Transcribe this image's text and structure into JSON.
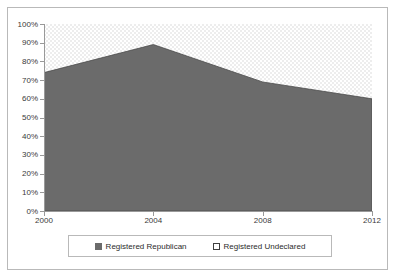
{
  "chart_data": {
    "type": "area",
    "stacked": true,
    "title": "",
    "subtitle": "",
    "xlabel": "",
    "ylabel": "",
    "x": [
      2000,
      2004,
      2008,
      2012
    ],
    "xticklabels": [
      "2000",
      "2004",
      "2008",
      "2012"
    ],
    "xlim": [
      2000,
      2012
    ],
    "ylim": [
      0,
      100
    ],
    "yticks": [
      0,
      10,
      20,
      30,
      40,
      50,
      60,
      70,
      80,
      90,
      100
    ],
    "yticklabels": [
      "0%",
      "10%",
      "20%",
      "30%",
      "40%",
      "50%",
      "60%",
      "70%",
      "80%",
      "90%",
      "100%"
    ],
    "grid": false,
    "legend_position": "bottom",
    "series": [
      {
        "name": "Registered Republican",
        "values": [
          74,
          89,
          69,
          60
        ],
        "color": "#6b6b6b",
        "swatch": "filled"
      },
      {
        "name": "Registered Undeclared",
        "values": [
          26,
          11,
          31,
          40
        ],
        "color": "#ffffff",
        "swatch": "hollow"
      }
    ]
  },
  "axes": {
    "y_labels": [
      "100%",
      "90%",
      "80%",
      "70%",
      "60%",
      "50%",
      "40%",
      "30%",
      "20%",
      "10%",
      "0%"
    ],
    "x_labels": [
      "2000",
      "2004",
      "2008",
      "2012"
    ]
  },
  "legend": {
    "items": [
      {
        "label": "Registered Republican",
        "swatch": "filled"
      },
      {
        "label": "Registered Undeclared",
        "swatch": "hollow"
      }
    ]
  },
  "colors": {
    "republican_fill": "#6b6b6b",
    "undeclared_fill": "#ffffff",
    "undeclared_pattern": "#ededed",
    "axis": "#999999",
    "frame_border": "#b9b9b9",
    "text": "#3a3a3a"
  }
}
